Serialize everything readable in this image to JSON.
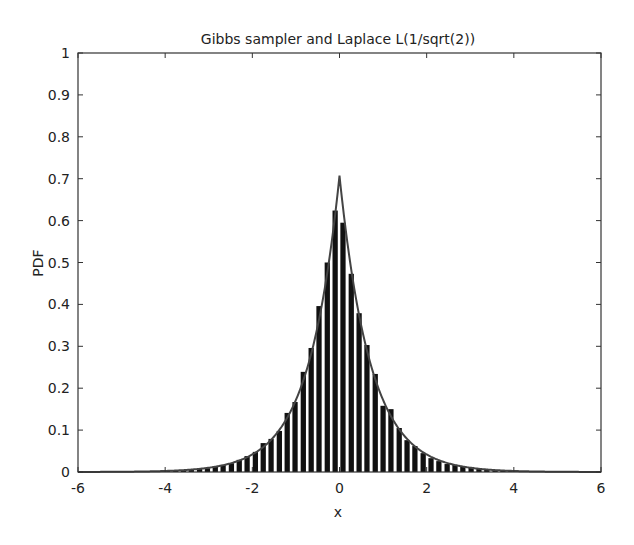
{
  "chart_data": {
    "type": "bar",
    "title": "Gibbs sampler and Laplace L(1/sqrt(2))",
    "xlabel": "x",
    "ylabel": "PDF",
    "xlim": [
      -6,
      6
    ],
    "ylim": [
      0,
      1
    ],
    "xticks": [
      -6,
      -4,
      -2,
      0,
      2,
      4,
      6
    ],
    "xtick_labels": [
      "-6",
      "-4",
      "-2",
      "0",
      "2",
      "4",
      "6"
    ],
    "yticks": [
      0,
      0.1,
      0.2,
      0.3,
      0.4,
      0.5,
      0.6,
      0.7,
      0.8,
      0.9,
      1
    ],
    "ytick_labels": [
      "0",
      "0.1",
      "0.2",
      "0.3",
      "0.4",
      "0.5",
      "0.6",
      "0.7",
      "0.8",
      "0.9",
      "1"
    ],
    "grid": false,
    "legend": null,
    "bar_color": "#111111",
    "line_color": "#444444",
    "bin_width": 0.183,
    "series": [
      {
        "name": "Gibbs sampler histogram",
        "kind": "bar",
        "x": [
          -4.13,
          -3.95,
          -3.76,
          -3.58,
          -3.4,
          -3.21,
          -3.03,
          -2.85,
          -2.67,
          -2.48,
          -2.3,
          -2.12,
          -1.93,
          -1.75,
          -1.57,
          -1.38,
          -1.2,
          -1.02,
          -0.83,
          -0.65,
          -0.47,
          -0.28,
          -0.1,
          0.08,
          0.27,
          0.45,
          0.63,
          0.82,
          1.0,
          1.18,
          1.37,
          1.55,
          1.73,
          1.92,
          2.1,
          2.28,
          2.47,
          2.65,
          2.83,
          3.02,
          3.2,
          3.38,
          3.57,
          3.75,
          3.93,
          4.12
        ],
        "values": [
          0.002,
          0.003,
          0.003,
          0.004,
          0.006,
          0.007,
          0.009,
          0.012,
          0.017,
          0.021,
          0.029,
          0.038,
          0.048,
          0.069,
          0.079,
          0.098,
          0.141,
          0.167,
          0.239,
          0.296,
          0.396,
          0.5,
          0.624,
          0.595,
          0.473,
          0.379,
          0.303,
          0.234,
          0.158,
          0.15,
          0.105,
          0.076,
          0.062,
          0.045,
          0.033,
          0.026,
          0.019,
          0.017,
          0.014,
          0.012,
          0.009,
          0.007,
          0.005,
          0.004,
          0.003,
          0.002
        ]
      },
      {
        "name": "Laplace L(1/sqrt(2)) density",
        "kind": "line",
        "formula": "f(x) = (1/sqrt(2)) * exp(-sqrt(2)*|x|)",
        "peak": 0.7071,
        "x_range": [
          -6,
          6
        ]
      }
    ]
  }
}
